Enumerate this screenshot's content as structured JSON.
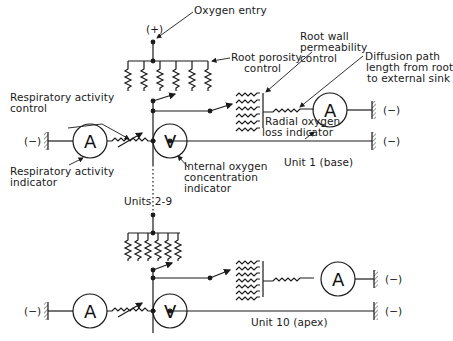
{
  "diagram": {
    "type": "electrical-analogue-circuit",
    "labels": {
      "oxygen_entry": "Oxygen entry",
      "plus_terminal": "(+)",
      "root_porosity_control_1": "Root porosity",
      "root_porosity_control_2": "control",
      "root_wall_1": "Root wall",
      "root_wall_2": "permeability",
      "root_wall_3": "control",
      "diffusion_1": "Diffusion path",
      "diffusion_2": "length from root",
      "diffusion_3": "to external sink",
      "resp_control_1": "Respiratory activity",
      "resp_control_2": "control",
      "resp_indicator_1": "Respiratory activity",
      "resp_indicator_2": "indicator",
      "radial_1": "Radial oxygen",
      "radial_2": "loss indicator",
      "internal_1": "Internal oxygen",
      "internal_2": "concentration",
      "internal_3": "indicator",
      "unit1": "Unit 1 (base)",
      "units_mid": "Units 2-9",
      "unit10": "Unit 10 (apex)",
      "minus": "(−)"
    },
    "meter_symbols": {
      "ammeter": "A",
      "voltmeter": "V"
    },
    "units": [
      {
        "name": "Unit 1 (base)",
        "components": [
          "Root porosity control",
          "Respiratory activity control",
          "Respiratory activity indicator (A)",
          "Internal oxygen concentration indicator (V)",
          "Root wall permeability control",
          "Diffusion path resistor",
          "Radial oxygen loss indicator (A)"
        ]
      },
      {
        "name": "Units 2-9",
        "components": [
          "repeated units (dotted)"
        ]
      },
      {
        "name": "Unit 10 (apex)",
        "components": [
          "Root porosity control",
          "Respiratory activity control",
          "Respiratory activity indicator (A)",
          "Internal oxygen concentration indicator (V)",
          "Root wall permeability control",
          "Diffusion path resistor",
          "Radial oxygen loss indicator (A)"
        ]
      }
    ]
  }
}
